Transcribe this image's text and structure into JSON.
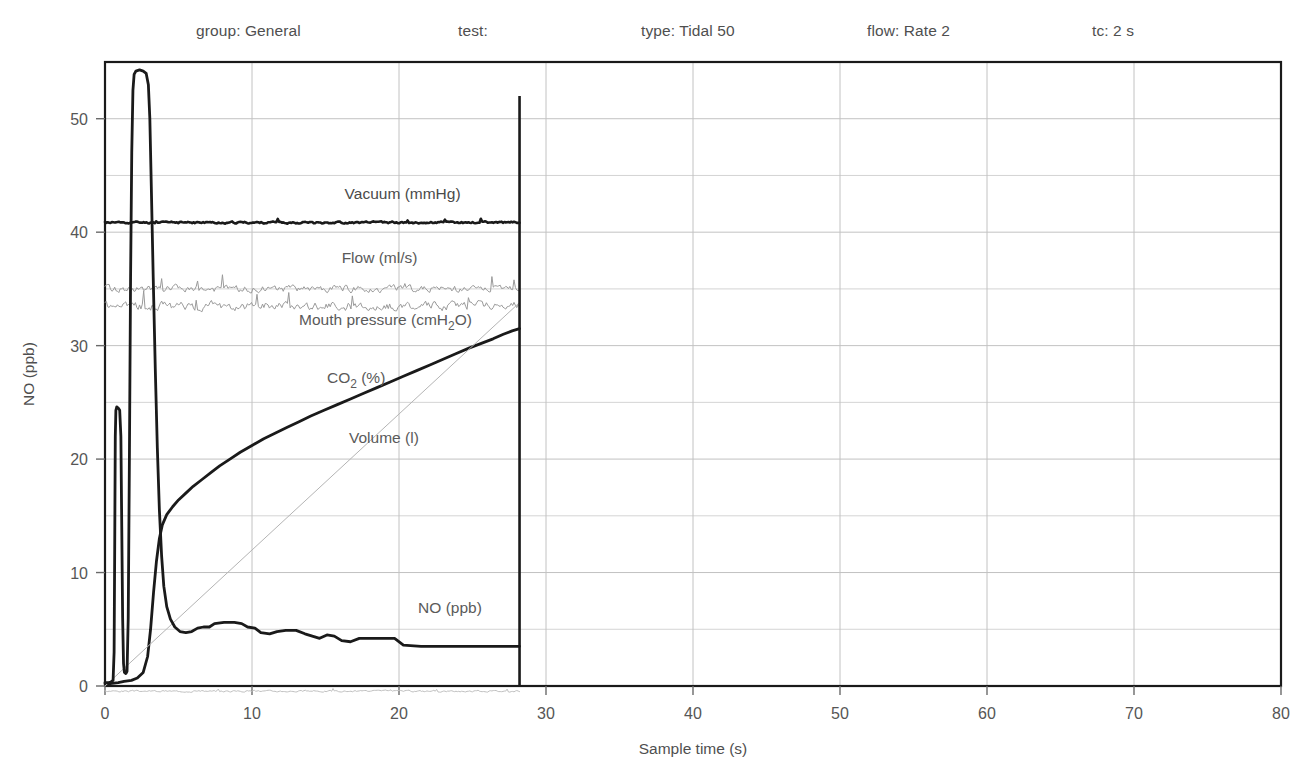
{
  "header": {
    "items": [
      {
        "label": "group: General",
        "x": 196
      },
      {
        "label": "test:",
        "x": 458
      },
      {
        "label": "type: Tidal 50",
        "x": 641
      },
      {
        "label": "flow: Rate 2",
        "x": 867
      },
      {
        "label": "tc: 2 s",
        "x": 1092
      }
    ]
  },
  "chart_data": {
    "type": "line",
    "title": "",
    "xlabel": "Sample time (s)",
    "ylabel": "NO (ppb)",
    "xlim": [
      0,
      80
    ],
    "ylim": [
      0,
      55
    ],
    "xticks": [
      0,
      10,
      20,
      30,
      40,
      50,
      60,
      70,
      80
    ],
    "xticklabels": [
      "0",
      "10",
      "20",
      "30",
      "40",
      "50",
      "60",
      "70",
      "80"
    ],
    "yticks": [
      0,
      10,
      20,
      30,
      40,
      50
    ],
    "yticklabels": [
      "0",
      "10",
      "20",
      "30",
      "40",
      "50"
    ],
    "yminor": [
      5,
      15,
      25,
      35,
      45
    ],
    "grid": true,
    "grid_color": "#c9c9c9",
    "cursor": {
      "x": 28.2,
      "label": "",
      "color": "#1a1a1a"
    },
    "data_end_x": 28.2,
    "series": [
      {
        "name": "Vacuum (mmHg)",
        "color": "#1a1a1a",
        "width": 2.6,
        "label_x": 16.3,
        "label_y": 42.9,
        "label_style": "dark",
        "baseline": 40.85,
        "noise": 0.16,
        "seed": 11
      },
      {
        "name": "Flow (ml/s)",
        "color": "#9a9a9a",
        "width": 1.0,
        "label_x": 16.1,
        "label_y": 37.3,
        "label_style": "light",
        "baseline": 35.0,
        "noise": 0.55,
        "seed": 29
      },
      {
        "name": "Mouth pressure (cmH2O)",
        "color": "#9a9a9a",
        "width": 1.0,
        "label_x": 13.2,
        "label_y": 31.8,
        "label_style": "light",
        "baseline": 33.5,
        "noise": 0.7,
        "seed": 47
      },
      {
        "name": "CO2 (%)",
        "color": "#1a1a1a",
        "width": 2.8,
        "label_x": 15.1,
        "label_y": 26.7,
        "label_style": "light",
        "points": [
          [
            0.0,
            0.2
          ],
          [
            0.35,
            0.2
          ],
          [
            0.9,
            0.3
          ],
          [
            1.3,
            0.4
          ],
          [
            1.8,
            0.5
          ],
          [
            2.2,
            0.7
          ],
          [
            2.6,
            1.2
          ],
          [
            2.9,
            2.6
          ],
          [
            3.1,
            5.0
          ],
          [
            3.3,
            8.2
          ],
          [
            3.5,
            11.0
          ],
          [
            3.7,
            13.0
          ],
          [
            3.9,
            14.2
          ],
          [
            4.2,
            15.1
          ],
          [
            4.6,
            15.8
          ],
          [
            5.0,
            16.4
          ],
          [
            5.5,
            17.0
          ],
          [
            6.0,
            17.6
          ],
          [
            6.6,
            18.2
          ],
          [
            7.2,
            18.8
          ],
          [
            7.8,
            19.4
          ],
          [
            8.5,
            20.0
          ],
          [
            9.2,
            20.6
          ],
          [
            10.0,
            21.2
          ],
          [
            10.8,
            21.8
          ],
          [
            11.6,
            22.3
          ],
          [
            12.4,
            22.8
          ],
          [
            13.2,
            23.3
          ],
          [
            14.0,
            23.8
          ],
          [
            14.9,
            24.3
          ],
          [
            15.8,
            24.8
          ],
          [
            16.7,
            25.3
          ],
          [
            17.6,
            25.8
          ],
          [
            18.5,
            26.3
          ],
          [
            19.4,
            26.8
          ],
          [
            20.3,
            27.3
          ],
          [
            21.2,
            27.8
          ],
          [
            22.1,
            28.3
          ],
          [
            23.0,
            28.8
          ],
          [
            23.9,
            29.3
          ],
          [
            24.8,
            29.8
          ],
          [
            25.6,
            30.2
          ],
          [
            26.4,
            30.6
          ],
          [
            27.1,
            31.0
          ],
          [
            27.7,
            31.3
          ],
          [
            28.2,
            31.5
          ]
        ]
      },
      {
        "name": "Volume (l)",
        "color": "#b4b4b4",
        "width": 1.0,
        "label_x": 16.6,
        "label_y": 21.4,
        "label_style": "light",
        "points": [
          [
            0.0,
            0.0
          ],
          [
            28.2,
            33.8
          ]
        ]
      },
      {
        "name": "NO (ppb)",
        "color": "#1a1a1a",
        "width": 2.8,
        "label_x": 21.3,
        "label_y": 6.4,
        "label_style": "light",
        "points": [
          [
            0.0,
            0.3
          ],
          [
            0.25,
            0.3
          ],
          [
            0.4,
            0.35
          ],
          [
            0.55,
            0.5
          ],
          [
            0.62,
            3.0
          ],
          [
            0.66,
            12.0
          ],
          [
            0.7,
            22.0
          ],
          [
            0.74,
            24.3
          ],
          [
            0.8,
            24.6
          ],
          [
            0.9,
            24.5
          ],
          [
            1.0,
            24.3
          ],
          [
            1.08,
            22.0
          ],
          [
            1.14,
            14.0
          ],
          [
            1.2,
            6.0
          ],
          [
            1.26,
            2.0
          ],
          [
            1.32,
            1.2
          ],
          [
            1.42,
            1.1
          ],
          [
            1.5,
            1.3
          ],
          [
            1.58,
            6.0
          ],
          [
            1.66,
            20.0
          ],
          [
            1.74,
            36.0
          ],
          [
            1.82,
            47.0
          ],
          [
            1.9,
            52.5
          ],
          [
            1.98,
            53.9
          ],
          [
            2.1,
            54.2
          ],
          [
            2.35,
            54.3
          ],
          [
            2.6,
            54.2
          ],
          [
            2.8,
            54.0
          ],
          [
            2.95,
            53.0
          ],
          [
            3.05,
            50.0
          ],
          [
            3.15,
            44.0
          ],
          [
            3.28,
            36.0
          ],
          [
            3.42,
            28.0
          ],
          [
            3.56,
            21.0
          ],
          [
            3.7,
            15.5
          ],
          [
            3.85,
            11.5
          ],
          [
            4.0,
            8.8
          ],
          [
            4.2,
            7.0
          ],
          [
            4.45,
            5.9
          ],
          [
            4.75,
            5.2
          ],
          [
            5.1,
            4.8
          ],
          [
            5.5,
            4.7
          ],
          [
            5.9,
            4.8
          ],
          [
            6.3,
            5.1
          ],
          [
            6.7,
            5.2
          ],
          [
            7.1,
            5.2
          ],
          [
            7.45,
            5.5
          ],
          [
            8.1,
            5.6
          ],
          [
            8.8,
            5.6
          ],
          [
            9.3,
            5.5
          ],
          [
            9.7,
            5.2
          ],
          [
            10.2,
            5.1
          ],
          [
            10.6,
            4.7
          ],
          [
            11.2,
            4.6
          ],
          [
            11.7,
            4.8
          ],
          [
            12.3,
            4.9
          ],
          [
            13.0,
            4.9
          ],
          [
            13.6,
            4.6
          ],
          [
            14.1,
            4.4
          ],
          [
            14.6,
            4.2
          ],
          [
            15.1,
            4.5
          ],
          [
            15.6,
            4.4
          ],
          [
            16.1,
            4.0
          ],
          [
            16.7,
            3.9
          ],
          [
            17.3,
            4.2
          ],
          [
            18.1,
            4.2
          ],
          [
            19.0,
            4.2
          ],
          [
            19.7,
            4.2
          ],
          [
            20.3,
            3.6
          ],
          [
            21.5,
            3.5
          ],
          [
            23.0,
            3.5
          ],
          [
            25.0,
            3.5
          ],
          [
            26.5,
            3.5
          ],
          [
            28.2,
            3.5
          ]
        ]
      },
      {
        "name": "baseline-trace",
        "color": "#c0c0c0",
        "width": 1.0,
        "label_x": null,
        "label_y": null,
        "label_style": "none",
        "baseline": -0.45,
        "noise": 0.13,
        "seed": 67
      }
    ]
  }
}
